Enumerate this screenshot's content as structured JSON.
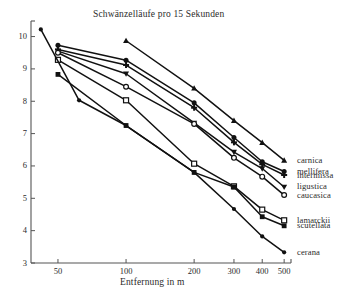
{
  "chart_data": {
    "type": "line",
    "title": "Schwänzelläufe pro 15 Sekunden",
    "xlabel": "Entfernung in m",
    "ylabel": "",
    "x_scale": "log",
    "x_ticks": [
      50,
      100,
      200,
      300,
      400,
      500
    ],
    "x_tick_labels": [
      "50",
      "100",
      "200",
      "300",
      "400",
      "500"
    ],
    "xlim": [
      38,
      520
    ],
    "y_ticks": [
      3,
      4,
      5,
      6,
      7,
      8,
      9,
      10
    ],
    "y_tick_labels": [
      "3",
      "4",
      "5",
      "6",
      "7",
      "8",
      "9",
      "10"
    ],
    "ylim": [
      3,
      10.45
    ],
    "grid": false,
    "legend_position": "right",
    "series": [
      {
        "name": "carnica",
        "marker": "filled-triangle-up",
        "x": [
          100,
          200,
          300,
          400,
          500
        ],
        "values": [
          9.87,
          8.4,
          7.4,
          6.72,
          6.17
        ]
      },
      {
        "name": "mellifera",
        "marker": "filled-circle",
        "x": [
          50,
          100,
          200,
          300,
          400,
          500
        ],
        "values": [
          9.73,
          9.27,
          7.95,
          6.88,
          6.13,
          5.83
        ]
      },
      {
        "name": "intermissa",
        "marker": "plus-cross",
        "x": [
          50,
          100,
          200,
          300,
          400,
          500
        ],
        "values": [
          9.6,
          9.12,
          7.8,
          6.73,
          6.05,
          5.72
        ]
      },
      {
        "name": "ligustica",
        "marker": "filled-triangle-down",
        "x": [
          50,
          100,
          200,
          300,
          400,
          500
        ],
        "values": [
          9.55,
          8.85,
          7.33,
          6.43,
          5.92,
          5.35
        ]
      },
      {
        "name": "caucasica",
        "marker": "open-circle",
        "x": [
          50,
          100,
          200,
          300,
          400,
          500
        ],
        "values": [
          9.5,
          8.45,
          7.3,
          6.25,
          5.67,
          5.1
        ]
      },
      {
        "name": "lamarckii",
        "marker": "open-square",
        "x": [
          50,
          100,
          200,
          300,
          400,
          500
        ],
        "values": [
          9.28,
          8.03,
          6.07,
          5.37,
          4.65,
          4.32
        ]
      },
      {
        "name": "scutellata",
        "marker": "filled-square",
        "x": [
          50,
          100,
          200,
          300,
          400,
          500
        ],
        "values": [
          8.83,
          7.25,
          5.8,
          5.35,
          4.43,
          4.15
        ]
      },
      {
        "name": "cerana",
        "marker": "filled-circle-small",
        "x": [
          42,
          62,
          100,
          200,
          300,
          400,
          500
        ],
        "values": [
          10.22,
          8.03,
          7.25,
          5.8,
          4.67,
          3.82,
          3.33
        ]
      }
    ],
    "legend": [
      {
        "label": "carnica",
        "marker": "filled-triangle-up"
      },
      {
        "label": "mellifera",
        "marker": "filled-circle"
      },
      {
        "label": "intermissa",
        "marker": "plus-cross"
      },
      {
        "label": "ligustica",
        "marker": "filled-triangle-down"
      },
      {
        "label": "caucasica",
        "marker": "open-circle"
      },
      {
        "label": "lamarckii",
        "marker": "open-square"
      },
      {
        "label": "scutellata",
        "marker": "filled-square"
      },
      {
        "label": "cerana",
        "marker": "filled-circle-small"
      }
    ],
    "colors": {
      "line": "#111111",
      "axis": "#555555",
      "text": "#2b2b2b",
      "background": "#ffffff"
    }
  }
}
